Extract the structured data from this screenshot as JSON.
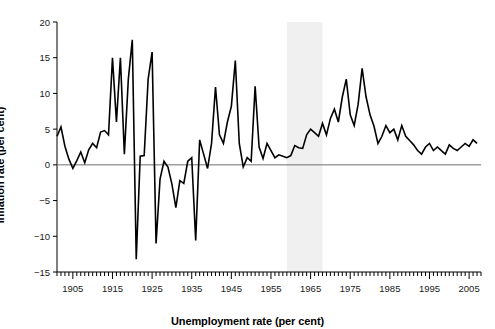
{
  "chart_data": {
    "type": "line",
    "title": "",
    "xlabel": "Unemployment rate (per cent)",
    "ylabel": "Inflation rate (per cent)",
    "xlim": [
      1901,
      2008
    ],
    "ylim": [
      -15,
      20
    ],
    "yticks": [
      -15,
      -10,
      -5,
      0,
      5,
      10,
      15,
      20
    ],
    "ytick_labels": [
      "−15",
      "−10",
      "−5",
      "0",
      "5",
      "10",
      "15",
      "20"
    ],
    "xticks": [
      1905,
      1915,
      1925,
      1935,
      1945,
      1955,
      1965,
      1975,
      1985,
      1995,
      2005
    ],
    "xtick_labels": [
      "1905",
      "1915",
      "1925",
      "1935",
      "1945",
      "1955",
      "1965",
      "1975",
      "1985",
      "1995",
      "2005"
    ],
    "minor_xtick_step": 1,
    "grid": false,
    "legend": null,
    "zero_line": 0,
    "zero_line_color": "#6e6e6e",
    "line_color": "#000000",
    "line_width": 1.6,
    "shaded_region": {
      "x0": 1959,
      "x1": 1968,
      "color": "#f0f0f0",
      "label": ""
    },
    "x": [
      1901,
      1902,
      1903,
      1904,
      1905,
      1906,
      1907,
      1908,
      1909,
      1910,
      1911,
      1912,
      1913,
      1914,
      1915,
      1916,
      1917,
      1918,
      1919,
      1920,
      1921,
      1922,
      1923,
      1924,
      1925,
      1926,
      1927,
      1928,
      1929,
      1930,
      1931,
      1932,
      1933,
      1934,
      1935,
      1936,
      1937,
      1938,
      1939,
      1940,
      1941,
      1942,
      1943,
      1944,
      1945,
      1946,
      1947,
      1948,
      1949,
      1950,
      1951,
      1952,
      1953,
      1954,
      1955,
      1956,
      1957,
      1958,
      1959,
      1960,
      1961,
      1962,
      1963,
      1964,
      1965,
      1966,
      1967,
      1968,
      1969,
      1970,
      1971,
      1972,
      1973,
      1974,
      1975,
      1976,
      1977,
      1978,
      1979,
      1980,
      1981,
      1982,
      1983,
      1984,
      1985,
      1986,
      1987,
      1988,
      1989,
      1990,
      1991,
      1992,
      1993,
      1994,
      1995,
      1996,
      1997,
      1998,
      1999,
      2000,
      2001,
      2002,
      2003,
      2004,
      2005,
      2006,
      2007
    ],
    "y": [
      4.0,
      5.3,
      2.6,
      0.8,
      -0.5,
      0.6,
      1.8,
      0.3,
      2.1,
      3.0,
      2.4,
      4.6,
      4.8,
      4.2,
      15.0,
      6.0,
      15.0,
      1.5,
      12.0,
      17.5,
      -13.2,
      1.2,
      1.3,
      12.0,
      15.8,
      -11.0,
      -2.0,
      0.5,
      -0.3,
      -2.7,
      -6.0,
      -2.2,
      -2.6,
      0.5,
      1.0,
      -10.6,
      3.5,
      1.5,
      -0.5,
      3.0,
      10.9,
      4.2,
      3.0,
      6.0,
      8.2,
      14.6,
      3.0,
      -0.3,
      1.0,
      0.5,
      11.0,
      2.5,
      0.9,
      3.0,
      2.0,
      1.0,
      1.4,
      1.2,
      1.0,
      1.3,
      2.7,
      2.4,
      2.3,
      4.2,
      5.0,
      4.5,
      4.0,
      5.8,
      4.2,
      6.5,
      7.8,
      6.0,
      9.5,
      12.0,
      7.0,
      5.5,
      8.5,
      13.5,
      9.5,
      7.0,
      5.4,
      3.0,
      4.0,
      5.5,
      4.5,
      5.0,
      3.5,
      5.5,
      4.0,
      3.4,
      2.8,
      2.0,
      1.5,
      2.5,
      3.0,
      2.0,
      2.5,
      2.0,
      1.5,
      2.8,
      2.3,
      2.0,
      2.5,
      3.0,
      2.6,
      3.5,
      3.0
    ]
  }
}
